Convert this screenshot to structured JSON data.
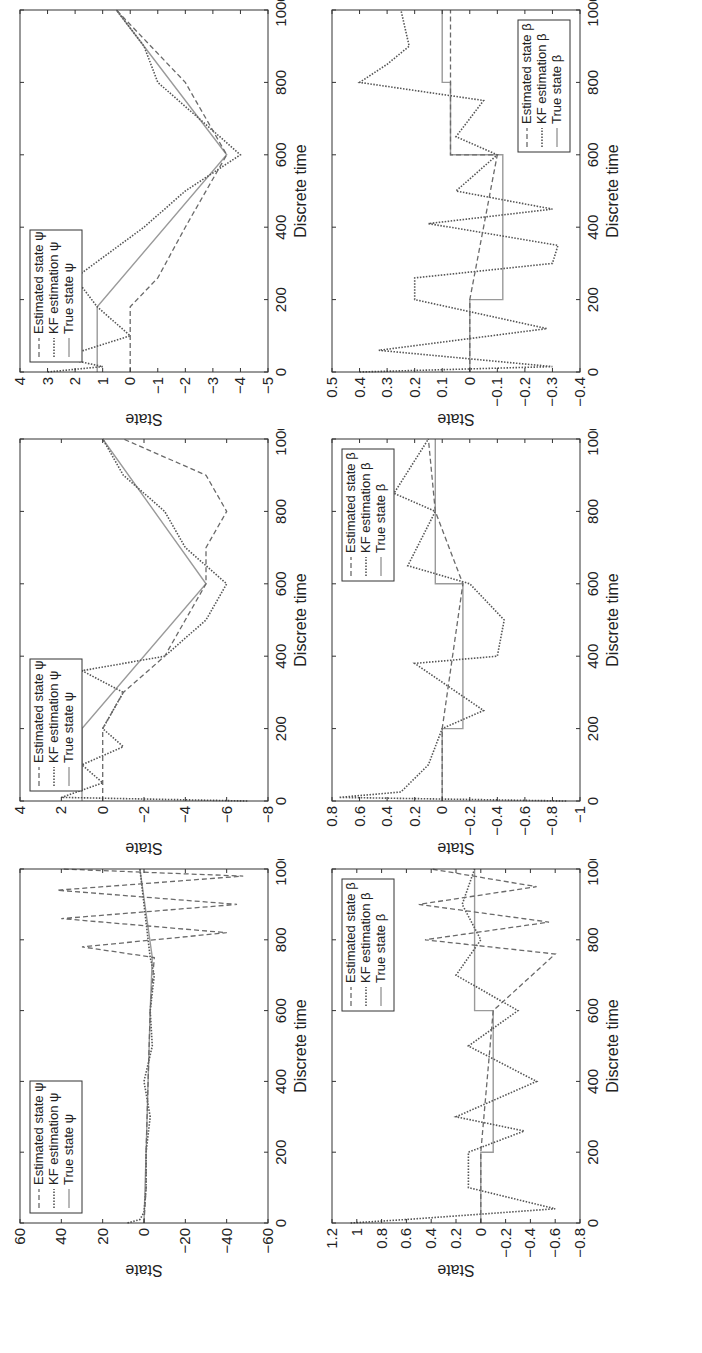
{
  "figure": {
    "orientation": "rotated -90deg",
    "layout": "2 rows x 3 columns (unrotated)"
  },
  "chart_data": [
    {
      "id": "psi_1",
      "type": "line",
      "title": "",
      "xlabel": "Discrete time",
      "ylabel": "State",
      "xlim": [
        0,
        1000
      ],
      "ylim": [
        -60,
        60
      ],
      "xticks": [
        0,
        200,
        400,
        600,
        800,
        1000
      ],
      "yticks": [
        -60,
        -40,
        -20,
        0,
        20,
        40,
        60
      ],
      "xtick_labels": [
        "0",
        "200",
        "400",
        "600",
        "800",
        "1000"
      ],
      "ytick_labels": [
        "−60",
        "−40",
        "−20",
        "0",
        "20",
        "40",
        "60"
      ],
      "legend": [
        "Estimated state ψ",
        "KF estimation ψ",
        "True state ψ"
      ],
      "legend_position": "upper left",
      "series": [
        {
          "name": "True state ψ",
          "style": "solid",
          "x": [
            0,
            200,
            400,
            600,
            750,
            1000
          ],
          "y": [
            0,
            -1,
            -2,
            -3,
            -4,
            2
          ]
        },
        {
          "name": "KF estimation ψ",
          "style": "dotted-marker",
          "x": [
            0,
            10,
            30,
            100,
            200,
            300,
            400,
            500,
            600,
            700,
            750,
            800,
            900,
            1000
          ],
          "y": [
            8,
            2,
            0,
            -1,
            -1,
            -3,
            0,
            -4,
            -3,
            -5,
            -3,
            -2,
            0,
            2
          ]
        },
        {
          "name": "Estimated state ψ",
          "style": "dashed",
          "x": [
            0,
            100,
            200,
            400,
            600,
            750,
            780,
            820,
            860,
            900,
            940,
            980,
            1000
          ],
          "y": [
            0,
            -1,
            -1,
            -2,
            -3,
            -5,
            30,
            -40,
            40,
            -45,
            42,
            -48,
            40
          ]
        }
      ]
    },
    {
      "id": "psi_2",
      "type": "line",
      "title": "",
      "xlabel": "Discrete time",
      "ylabel": "State",
      "xlim": [
        0,
        1000
      ],
      "ylim": [
        -8,
        4
      ],
      "xticks": [
        0,
        200,
        400,
        600,
        800,
        1000
      ],
      "yticks": [
        -8,
        -6,
        -4,
        -2,
        0,
        2,
        4
      ],
      "xtick_labels": [
        "0",
        "200",
        "400",
        "600",
        "800",
        "1000"
      ],
      "ytick_labels": [
        "−8",
        "−6",
        "−4",
        "−2",
        "0",
        "2",
        "4"
      ],
      "legend": [
        "Estimated state ψ",
        "KF estimation ψ",
        "True state ψ"
      ],
      "legend_position": "upper left",
      "series": [
        {
          "name": "True state ψ",
          "style": "solid",
          "x": [
            0,
            200,
            600,
            1000
          ],
          "y": [
            1,
            1,
            -5,
            0
          ]
        },
        {
          "name": "KF estimation ψ",
          "style": "dotted-marker",
          "x": [
            0,
            10,
            50,
            100,
            150,
            200,
            300,
            360,
            400,
            500,
            600,
            700,
            800,
            900,
            1000
          ],
          "y": [
            -7,
            2,
            0,
            1,
            -1,
            0,
            -1,
            1,
            -3,
            -5,
            -6,
            -4,
            -3,
            -1,
            0
          ]
        },
        {
          "name": "Estimated state ψ",
          "style": "dashed",
          "x": [
            0,
            200,
            300,
            400,
            500,
            600,
            700,
            800,
            900,
            1000
          ],
          "y": [
            0,
            0,
            -1,
            -3,
            -4,
            -5,
            -5,
            -6,
            -5,
            -1
          ]
        }
      ]
    },
    {
      "id": "psi_3",
      "type": "line",
      "title": "",
      "xlabel": "Discrete time",
      "ylabel": "State",
      "xlim": [
        0,
        1000
      ],
      "ylim": [
        -5,
        4
      ],
      "xticks": [
        0,
        200,
        400,
        600,
        800,
        1000
      ],
      "yticks": [
        -5,
        -4,
        -3,
        -2,
        -1,
        0,
        1,
        2,
        3,
        4
      ],
      "xtick_labels": [
        "0",
        "200",
        "400",
        "600",
        "800",
        "1000"
      ],
      "ytick_labels": [
        "−5",
        "−4",
        "−3",
        "−2",
        "−1",
        "0",
        "1",
        "2",
        "3",
        "4"
      ],
      "legend": [
        "Estimated state ψ",
        "KF estimation ψ",
        "True state ψ"
      ],
      "legend_position": "upper left",
      "series": [
        {
          "name": "True state ψ",
          "style": "solid",
          "x": [
            0,
            180,
            600,
            1000
          ],
          "y": [
            1.2,
            1.2,
            -3.5,
            0.5
          ]
        },
        {
          "name": "KF estimation ψ",
          "style": "dotted-marker",
          "x": [
            0,
            15,
            40,
            100,
            180,
            260,
            400,
            500,
            600,
            700,
            800,
            900,
            1000
          ],
          "y": [
            3,
            1,
            2.5,
            0,
            1.2,
            2,
            -0.5,
            -2,
            -4,
            -2.5,
            -1,
            -0.5,
            0.5
          ]
        },
        {
          "name": "Estimated state ψ",
          "style": "dashed",
          "x": [
            0,
            50,
            180,
            260,
            400,
            600,
            800,
            1000
          ],
          "y": [
            0,
            0,
            0,
            -1,
            -2,
            -3.5,
            -2,
            0.5
          ]
        }
      ]
    },
    {
      "id": "beta_1",
      "type": "line",
      "title": "",
      "xlabel": "Discrete time",
      "ylabel": "State",
      "xlim": [
        0,
        1000
      ],
      "ylim": [
        -0.8,
        1.2
      ],
      "xticks": [
        0,
        200,
        400,
        600,
        800,
        1000
      ],
      "yticks": [
        -0.8,
        -0.6,
        -0.4,
        -0.2,
        0,
        0.2,
        0.4,
        0.6,
        0.8,
        1,
        1.2
      ],
      "xtick_labels": [
        "0",
        "200",
        "400",
        "600",
        "800",
        "1000"
      ],
      "ytick_labels": [
        "−0.8",
        "−0.6",
        "−0.4",
        "−0.2",
        "0",
        "0.2",
        "0.4",
        "0.6",
        "0.8",
        "1",
        "1.2"
      ],
      "legend": [
        "Estimated state β",
        "KF estimation β",
        "True state β"
      ],
      "legend_position": "upper right",
      "series": [
        {
          "name": "True state β",
          "style": "solid",
          "x": [
            0,
            200,
            200,
            600,
            600,
            800,
            800,
            1000
          ],
          "y": [
            0,
            0,
            -0.1,
            -0.1,
            0.05,
            0.05,
            0.05,
            0.05
          ]
        },
        {
          "name": "KF estimation β",
          "style": "dotted-marker",
          "x": [
            0,
            10,
            40,
            100,
            200,
            260,
            300,
            400,
            500,
            600,
            700,
            800,
            900,
            1000
          ],
          "y": [
            1.05,
            0.6,
            -0.6,
            0.1,
            0.1,
            -0.35,
            0.2,
            -0.45,
            0.1,
            -0.3,
            0.2,
            0.0,
            0.15,
            0.05
          ]
        },
        {
          "name": "Estimated state β",
          "style": "dashed",
          "x": [
            0,
            200,
            600,
            760,
            800,
            850,
            900,
            950,
            1000
          ],
          "y": [
            0,
            0,
            -0.1,
            -0.6,
            0.45,
            -0.55,
            0.5,
            -0.45,
            0.4
          ]
        }
      ]
    },
    {
      "id": "beta_2",
      "type": "line",
      "title": "",
      "xlabel": "Discrete time",
      "ylabel": "State",
      "xlim": [
        0,
        1000
      ],
      "ylim": [
        -1,
        0.8
      ],
      "xticks": [
        0,
        200,
        400,
        600,
        800,
        1000
      ],
      "yticks": [
        -1,
        -0.8,
        -0.6,
        -0.4,
        -0.2,
        0,
        0.2,
        0.4,
        0.6,
        0.8
      ],
      "xtick_labels": [
        "0",
        "200",
        "400",
        "600",
        "800",
        "1000"
      ],
      "ytick_labels": [
        "−1",
        "−0.8",
        "−0.6",
        "−0.4",
        "−0.2",
        "0",
        "0.2",
        "0.4",
        "0.6",
        "0.8"
      ],
      "legend": [
        "Estimated state β",
        "KF estimation β",
        "True state β"
      ],
      "legend_position": "upper right",
      "series": [
        {
          "name": "True state β",
          "style": "solid",
          "x": [
            0,
            200,
            200,
            600,
            600,
            1000
          ],
          "y": [
            0,
            0,
            -0.15,
            -0.15,
            0.05,
            0.05
          ]
        },
        {
          "name": "KF estimation β",
          "style": "dotted-marker",
          "x": [
            0,
            10,
            25,
            100,
            200,
            250,
            380,
            400,
            500,
            600,
            650,
            800,
            850,
            1000
          ],
          "y": [
            -0.9,
            0.75,
            0.3,
            0.1,
            0,
            -0.3,
            0.2,
            -0.4,
            -0.45,
            -0.2,
            0.25,
            0.05,
            0.35,
            0.1
          ]
        },
        {
          "name": "Estimated state β",
          "style": "dashed",
          "x": [
            0,
            200,
            600,
            800,
            1000
          ],
          "y": [
            0,
            0,
            -0.15,
            0.05,
            0.1
          ]
        }
      ]
    },
    {
      "id": "beta_3",
      "type": "line",
      "title": "",
      "xlabel": "Discrete time",
      "ylabel": "State",
      "xlim": [
        0,
        1000
      ],
      "ylim": [
        -0.4,
        0.5
      ],
      "xticks": [
        0,
        200,
        400,
        600,
        800,
        1000
      ],
      "yticks": [
        -0.4,
        -0.3,
        -0.2,
        -0.1,
        0,
        0.1,
        0.2,
        0.3,
        0.4,
        0.5
      ],
      "xtick_labels": [
        "0",
        "200",
        "400",
        "600",
        "800",
        "1000"
      ],
      "ytick_labels": [
        "−0.4",
        "−0.3",
        "−0.2",
        "−0.1",
        "0",
        "0.1",
        "0.2",
        "0.3",
        "0.4",
        "0.5"
      ],
      "legend": [
        "Estimated state β",
        "KF estimation β",
        "True state β"
      ],
      "legend_position": "lower right",
      "series": [
        {
          "name": "True state β",
          "style": "solid",
          "x": [
            0,
            200,
            200,
            600,
            600,
            800,
            800,
            1000
          ],
          "y": [
            0,
            0,
            -0.12,
            -0.12,
            0.07,
            0.07,
            0.1,
            0.1
          ]
        },
        {
          "name": "KF estimation β",
          "style": "dotted-marker",
          "x": [
            0,
            15,
            60,
            120,
            200,
            260,
            300,
            350,
            410,
            450,
            500,
            600,
            650,
            750,
            800,
            850,
            900,
            1000
          ],
          "y": [
            0.4,
            -0.3,
            0.33,
            -0.28,
            0.2,
            0.2,
            -0.3,
            -0.32,
            0.15,
            -0.3,
            0.05,
            -0.1,
            0.05,
            -0.05,
            0.4,
            0.3,
            0.22,
            0.25
          ]
        },
        {
          "name": "Estimated state β",
          "style": "dashed",
          "x": [
            0,
            200,
            600,
            600,
            800,
            1000
          ],
          "y": [
            0,
            0,
            -0.1,
            0.07,
            0.07,
            0.07
          ]
        }
      ]
    }
  ],
  "panels": {
    "psi_1": {
      "xlabel": "Discrete time",
      "ylabel": "State",
      "legend": [
        "Estimated state ψ",
        "KF estimation ψ",
        "True state ψ"
      ]
    },
    "psi_2": {
      "xlabel": "Discrete time",
      "ylabel": "State",
      "legend": [
        "Estimated state ψ",
        "KF estimation ψ",
        "True state ψ"
      ]
    },
    "psi_3": {
      "xlabel": "Discrete time",
      "ylabel": "State",
      "legend": [
        "Estimated state ψ",
        "KF estimation ψ",
        "True state ψ"
      ]
    },
    "beta_1": {
      "xlabel": "Discrete time",
      "ylabel": "State",
      "legend": [
        "Estimated state β",
        "KF estimation β",
        "True state β"
      ]
    },
    "beta_2": {
      "xlabel": "Discrete time",
      "ylabel": "State",
      "legend": [
        "Estimated state β",
        "KF estimation β",
        "True state β"
      ]
    },
    "beta_3": {
      "xlabel": "Discrete time",
      "ylabel": "State",
      "legend": [
        "Estimated state β",
        "KF estimation β",
        "True state β"
      ]
    }
  },
  "colors": {
    "axis": "#333333",
    "true_state": "#9a9a9a",
    "kf_estimation": "#555555",
    "estimated_state": "#6a6a6a",
    "legend_border": "#333333"
  }
}
